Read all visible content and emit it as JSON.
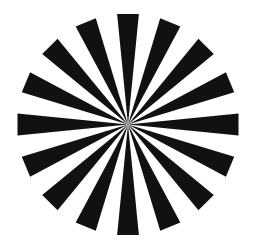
{
  "figure": {
    "type": "siemens-star",
    "spoke_count": 16,
    "spoke_color": "#111111",
    "background_color": "#ffffff"
  }
}
